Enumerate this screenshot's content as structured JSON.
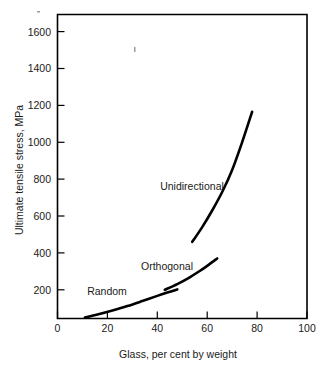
{
  "chart_data": {
    "type": "line",
    "title": "",
    "xlabel": "Glass, per cent by weight",
    "ylabel": "Ultimate tensile stress, MPa",
    "xlim": [
      0,
      100
    ],
    "ylim": [
      0,
      1700
    ],
    "grid": false,
    "legend_position": "inline-annotations",
    "xticks": [
      "0",
      "20",
      "40",
      "60",
      "80",
      "100"
    ],
    "xtick_values": [
      0,
      20,
      40,
      60,
      80,
      100
    ],
    "yticks": [
      "200",
      "400",
      "600",
      "800",
      "1000",
      "1200",
      "1400",
      "1600"
    ],
    "ytick_values": [
      200,
      400,
      600,
      800,
      1000,
      1200,
      1400,
      1600
    ],
    "series": [
      {
        "name": "Random",
        "label": "Random",
        "x": [
          11,
          16,
          22,
          28,
          34,
          40,
          44,
          48
        ],
        "values": [
          50,
          66,
          88,
          112,
          139,
          167,
          185,
          202
        ]
      },
      {
        "name": "Orthogonal",
        "label": "Orthogonal",
        "x": [
          43,
          48,
          53,
          57,
          60,
          64
        ],
        "values": [
          200,
          231,
          268,
          302,
          330,
          370
        ]
      },
      {
        "name": "Unidirectional",
        "label": "Unidirectional",
        "x": [
          54,
          58,
          62,
          66,
          70,
          74,
          78
        ],
        "values": [
          460,
          540,
          630,
          730,
          850,
          1000,
          1165
        ]
      }
    ]
  },
  "figure": {
    "axis_color": "#000000",
    "curve_color": "#000000",
    "background": "#ffffff"
  }
}
